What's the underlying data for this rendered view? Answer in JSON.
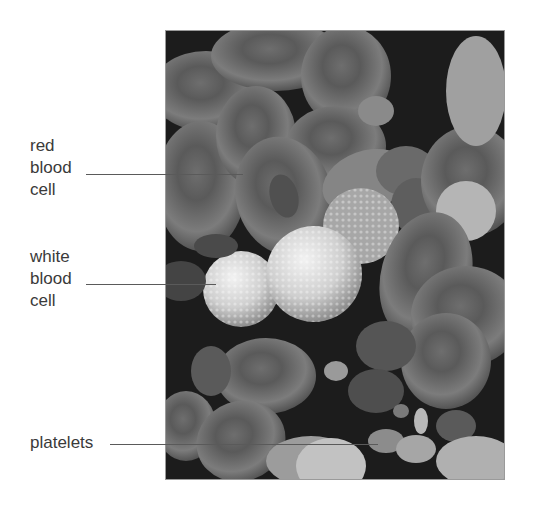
{
  "figure": {
    "labels": [
      {
        "id": "red-blood-cell",
        "lines": [
          "red",
          "blood",
          "cell"
        ]
      },
      {
        "id": "white-blood-cell",
        "lines": [
          "white",
          "blood",
          "cell"
        ]
      },
      {
        "id": "platelets",
        "lines": [
          "platelets"
        ]
      }
    ]
  },
  "colors": {
    "background": "#ffffff",
    "label_text": "#3a3a3a",
    "leader_line": "#5a5a5a",
    "micrograph_bg": "#1a1a1a",
    "red_cell": "#7a7a7a",
    "white_cell": "#d6d6d6"
  }
}
